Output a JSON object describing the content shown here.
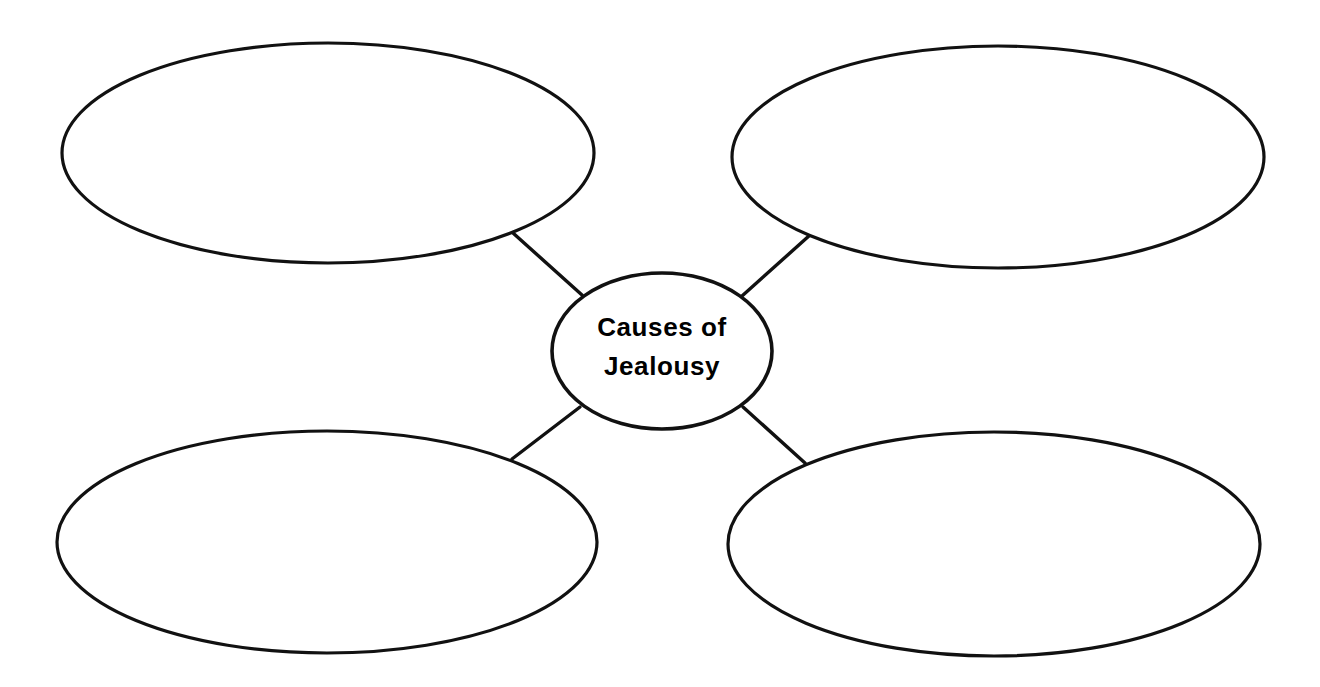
{
  "page": {
    "title": "Causes of Jealousy",
    "background_color": "#ffffff",
    "stroke_color": "#111111",
    "text_color": "#000000",
    "width": 1320,
    "height": 687
  },
  "center_node": {
    "label_line_1": "Causes of",
    "label_line_2": "Jealousy",
    "full_label": "Causes of Jealousy"
  },
  "bubbles": [
    {
      "id": "top-left",
      "label": "",
      "position": "top-left"
    },
    {
      "id": "top-right",
      "label": "",
      "position": "top-right"
    },
    {
      "id": "bottom-left",
      "label": "",
      "position": "bottom-left"
    },
    {
      "id": "bottom-right",
      "label": "",
      "position": "bottom-right"
    }
  ],
  "connectors": [
    {
      "id": "connector-top-left",
      "from": "center-node",
      "to": "top-left"
    },
    {
      "id": "connector-top-right",
      "from": "center-node",
      "to": "top-right"
    },
    {
      "id": "connector-bottom-left",
      "from": "center-node",
      "to": "bottom-left"
    },
    {
      "id": "connector-bottom-right",
      "from": "center-node",
      "to": "bottom-right"
    }
  ]
}
